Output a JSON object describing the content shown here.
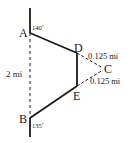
{
  "diagram": {
    "points": {
      "A": {
        "label": "A",
        "x": 30,
        "y": 33
      },
      "B": {
        "label": "B",
        "x": 30,
        "y": 118
      },
      "C": {
        "label": "C",
        "x": 105,
        "y": 69
      },
      "D": {
        "label": "D",
        "x": 77,
        "y": 53
      },
      "E": {
        "label": "E",
        "x": 77,
        "y": 86
      }
    },
    "angles": {
      "A": "140º",
      "B": "135º"
    },
    "lengths": {
      "AB": "2 mi",
      "DC": "0.125 mi",
      "EC": "0.125 mi"
    },
    "colors": {
      "line": "#1a1a1a",
      "text": "#222222"
    }
  }
}
